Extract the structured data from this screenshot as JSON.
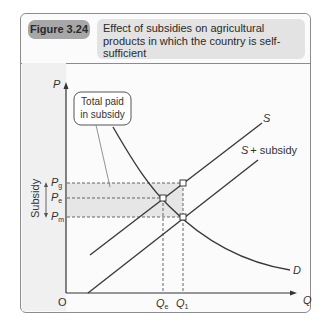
{
  "figure": {
    "number": "Figure 3.24",
    "title": "Effect of subsidies on agricultural products in which the country is self-sufficient"
  },
  "axes": {
    "y_label": "P",
    "x_label": "Q",
    "origin": "O"
  },
  "price_levels": {
    "pg_main": "P",
    "pg_sub": "g",
    "pe_main": "P",
    "pe_sub": "e",
    "pm_main": "P",
    "pm_sub": "m"
  },
  "quantity_levels": {
    "qe_main": "Q",
    "qe_sub": "e",
    "q1_main": "Q",
    "q1_sub": "1"
  },
  "curves": {
    "supply": "S",
    "supply_subsidy": "S + subsidy",
    "demand": "D"
  },
  "annotations": {
    "callout_line1": "Total paid",
    "callout_line2": "in subsidy",
    "subsidy_side": "Subsidy"
  },
  "colors": {
    "shade": "#e6e6e6",
    "line": "#3a3a3a",
    "badge": "#a7a7a7",
    "title_bg": "#e3e3e3"
  }
}
